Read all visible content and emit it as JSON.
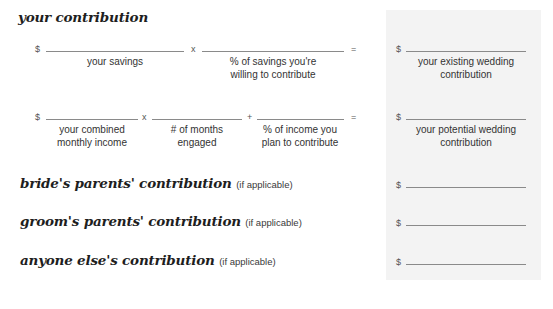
{
  "sections": {
    "your_contribution": {
      "title": "your contribution",
      "row1": {
        "currency": "$",
        "op1": "x",
        "op2": "=",
        "labels": {
          "savings": "your savings",
          "percent_line1": "% of savings you're",
          "percent_line2": "willing to contribute"
        },
        "result": {
          "currency": "$",
          "label_line1": "your existing wedding",
          "label_line2": "contribution"
        }
      },
      "row2": {
        "currency": "$",
        "op1": "x",
        "op2": "+",
        "op3": "=",
        "labels": {
          "income_line1": "your combined",
          "income_line2": "monthly income",
          "months_line1": "# of months",
          "months_line2": "engaged",
          "percent_line1": "% of income you",
          "percent_line2": "plan to contribute"
        },
        "result": {
          "currency": "$",
          "label_line1": "your potential wedding",
          "label_line2": "contribution"
        }
      }
    },
    "brides_parents": {
      "title": "bride's parents' contribution",
      "note": "(if applicable)",
      "currency": "$"
    },
    "grooms_parents": {
      "title": "groom's parents' contribution",
      "note": "(if applicable)",
      "currency": "$"
    },
    "anyone_else": {
      "title": "anyone else's contribution",
      "note": "(if applicable)",
      "currency": "$"
    }
  },
  "colors": {
    "panel_background": "#f3f3f3",
    "line": "#8a8a8a",
    "text": "#2b2b2b"
  }
}
